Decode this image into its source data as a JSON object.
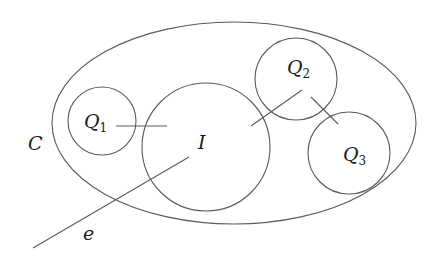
{
  "diagram": {
    "type": "set-diagram",
    "stroke_color": "#5a5a5a",
    "text_color": "#1a1a1a",
    "ellipse": {
      "name": "C",
      "label": "C",
      "cx": 234,
      "cy": 123,
      "rx": 182,
      "ry": 101,
      "label_x": 28,
      "label_y": 150
    },
    "circles": [
      {
        "name": "Q1",
        "label": "Q",
        "subscript": "1",
        "cx": 102,
        "cy": 121,
        "r": 34,
        "label_x": 84,
        "label_y": 128
      },
      {
        "name": "I",
        "label": "I",
        "subscript": "",
        "cx": 206,
        "cy": 147,
        "r": 64,
        "label_x": 198,
        "label_y": 148
      },
      {
        "name": "Q2",
        "label": "Q",
        "subscript": "2",
        "cx": 296,
        "cy": 79,
        "r": 41,
        "label_x": 287,
        "label_y": 74
      },
      {
        "name": "Q3",
        "label": "Q",
        "subscript": "3",
        "cx": 349,
        "cy": 153,
        "r": 41,
        "label_x": 344,
        "label_y": 160
      }
    ],
    "lines": [
      {
        "name": "e",
        "x1": 33,
        "y1": 248,
        "x2": 189,
        "y2": 157
      },
      {
        "name": "q1-link",
        "x1": 116,
        "y1": 126,
        "x2": 167,
        "y2": 126
      },
      {
        "name": "q2-i-link",
        "x1": 251,
        "y1": 126,
        "x2": 302,
        "y2": 90
      },
      {
        "name": "q2-q3-link",
        "x1": 311,
        "y1": 97,
        "x2": 338,
        "y2": 124
      }
    ],
    "edge_label": {
      "name": "e",
      "label": "e",
      "x": 83,
      "y": 240
    }
  }
}
